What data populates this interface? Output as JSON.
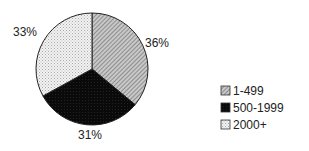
{
  "chart_data": {
    "type": "pie",
    "title": "",
    "categories": [
      "1-499",
      "500-1999",
      "2000+"
    ],
    "values": [
      36,
      31,
      33
    ],
    "labels": [
      "36%",
      "31%",
      "33%"
    ],
    "legend_position": "right",
    "start_angle": "12 o'clock, clockwise",
    "fills": [
      "diagonal-hatch-gray",
      "solid-black",
      "light-dotted"
    ]
  },
  "legend": {
    "items": [
      {
        "label": "1-499"
      },
      {
        "label": "500-1999"
      },
      {
        "label": "2000+"
      }
    ]
  },
  "slice_labels": [
    "36%",
    "31%",
    "33%"
  ]
}
